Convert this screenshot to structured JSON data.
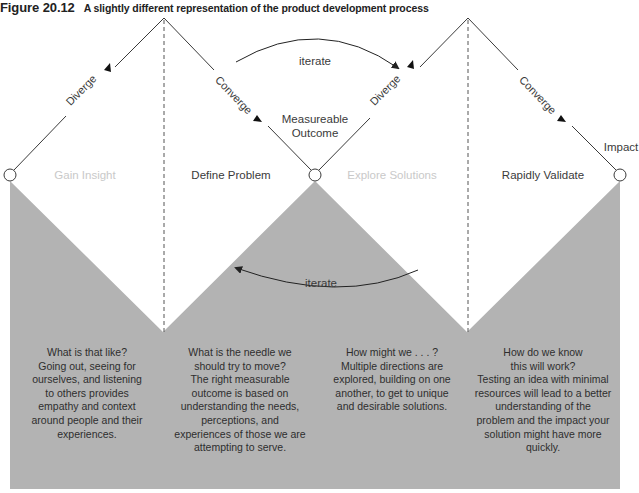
{
  "figure": {
    "number": "Figure 20.12",
    "caption": "A slightly different representation of the product development process"
  },
  "diagram": {
    "edge_labels": {
      "diverge_1": "Diverge",
      "converge_1": "Converge",
      "diverge_2": "Diverge",
      "converge_2": "Converge"
    },
    "node_labels": {
      "middle": "Measureable\nOutcome",
      "middle_line1": "Measureable",
      "middle_line2": "Outcome",
      "end": "Impact"
    },
    "iterate_top": "iterate",
    "iterate_bottom": "iterate",
    "phases": [
      {
        "label": "Gain Insight",
        "style": "light"
      },
      {
        "label": "Define Problem",
        "style": "dark"
      },
      {
        "label": "Explore Solutions",
        "style": "light"
      },
      {
        "label": "Rapidly Validate",
        "style": "dark"
      }
    ],
    "descriptions": [
      {
        "lines": [
          "What is that like?",
          "Going out, seeing for",
          "ourselves, and listening",
          "to others provides",
          "empathy and context",
          "around people and their",
          "experiences."
        ]
      },
      {
        "lines": [
          "What is the needle we",
          "should try to move?",
          "The right measurable",
          "outcome is based on",
          "understanding the needs,",
          "perceptions, and",
          "experiences of those we are",
          "attempting to serve."
        ]
      },
      {
        "lines": [
          "How might we . . . ?",
          "Multiple directions are",
          "explored, building on one",
          "another, to get to unique",
          "and desirable solutions."
        ]
      },
      {
        "lines": [
          "How do we know",
          "this will work?",
          "Testing an idea with minimal",
          "resources will lead to a better",
          "understanding of the",
          "problem and the impact your",
          "solution might have more",
          "quickly."
        ]
      }
    ],
    "colors": {
      "gray_fill": "#b3b3b3",
      "line": "#3a3a3a",
      "light_text": "#c9c9c9",
      "dark_text": "#3a3a3a"
    }
  }
}
